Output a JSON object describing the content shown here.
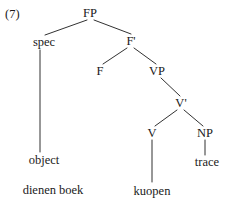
{
  "figure": {
    "example_number": "(7)",
    "type": "syntax-tree",
    "background_color": "#ffffff",
    "line_color": "#1a1a1a",
    "text_color": "#1a1a1a"
  },
  "nodes": {
    "root": "FP",
    "spec": "spec",
    "f_bar": "F'",
    "f_head": "F",
    "vp": "VP",
    "v_bar": "V'",
    "v_head": "V",
    "np": "NP"
  },
  "leaves": {
    "object": "object",
    "trace": "trace",
    "spec_word": "dienen boek",
    "v_word": "kuopen"
  },
  "tree_structure": {
    "label": "FP",
    "children": [
      {
        "label": "spec",
        "children": [
          {
            "label": "object",
            "children": [
              {
                "label": "dienen boek"
              }
            ]
          }
        ]
      },
      {
        "label": "F'",
        "children": [
          {
            "label": "F"
          },
          {
            "label": "VP",
            "children": [
              {
                "label": "V'",
                "children": [
                  {
                    "label": "V",
                    "children": [
                      {
                        "label": "kuopen"
                      }
                    ]
                  },
                  {
                    "label": "NP",
                    "children": [
                      {
                        "label": "trace"
                      }
                    ]
                  }
                ]
              }
            ]
          }
        ]
      }
    ]
  }
}
